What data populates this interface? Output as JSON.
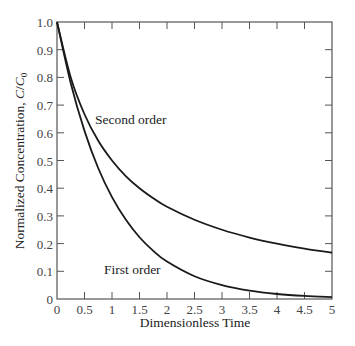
{
  "chart_data": {
    "type": "line",
    "title": "",
    "xlabel": "Dimensionless Time",
    "ylabel": "Normalized Concentration, C/C0",
    "ylabel_parts": {
      "main": "Normalized Concentration, ",
      "c": "C",
      "slash": "/",
      "c0": "C",
      "sub": "0"
    },
    "xlim": [
      0,
      5
    ],
    "ylim": [
      0,
      1.0
    ],
    "grid": false,
    "legend": "none (inline labels)",
    "x_ticks": [
      0,
      0.5,
      1,
      1.5,
      2,
      2.5,
      3,
      3.5,
      4,
      4.5,
      5
    ],
    "x_tick_labels": [
      "0",
      "0.5",
      "1",
      "1.5",
      "2",
      "2.5",
      "3",
      "3.5",
      "4",
      "4.5",
      "5"
    ],
    "y_ticks": [
      0,
      0.1,
      0.2,
      0.3,
      0.4,
      0.5,
      0.6,
      0.7,
      0.8,
      0.9,
      1.0
    ],
    "y_tick_labels": [
      "0",
      "0.1",
      "0.2",
      "0.3",
      "0.4",
      "0.5",
      "0.6",
      "0.7",
      "0.8",
      "0.9",
      "1.0"
    ],
    "x": [
      0,
      0.25,
      0.5,
      0.75,
      1,
      1.25,
      1.5,
      1.75,
      2,
      2.5,
      3,
      3.5,
      4,
      4.5,
      5
    ],
    "series": [
      {
        "name": "First order",
        "label": "First order",
        "values": [
          1.0,
          0.779,
          0.607,
          0.472,
          0.368,
          0.287,
          0.223,
          0.174,
          0.135,
          0.082,
          0.05,
          0.03,
          0.018,
          0.011,
          0.007
        ],
        "label_pos": {
          "x": 104,
          "y": 274
        }
      },
      {
        "name": "Second order",
        "label": "Second order",
        "values": [
          1.0,
          0.8,
          0.667,
          0.571,
          0.5,
          0.444,
          0.4,
          0.364,
          0.333,
          0.286,
          0.25,
          0.222,
          0.2,
          0.182,
          0.167
        ],
        "label_pos": {
          "x": 95,
          "y": 124
        }
      }
    ],
    "colors": {
      "line": "#1a1a1a",
      "axis": "#555555"
    }
  }
}
